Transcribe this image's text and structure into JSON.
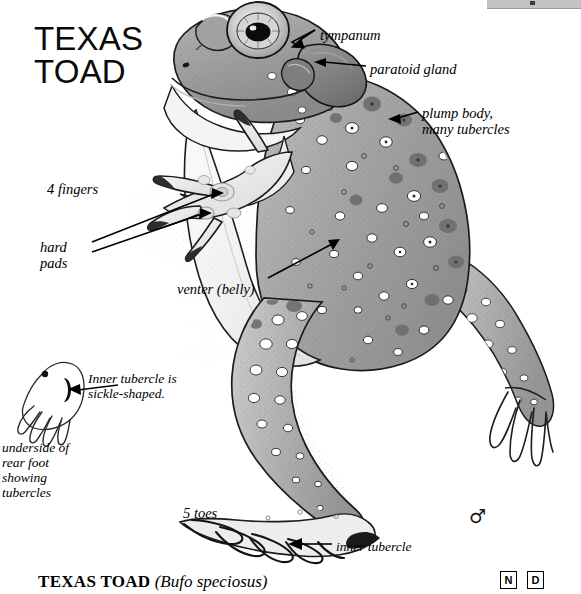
{
  "plate": {
    "title": "TEXAS\nTOAD",
    "background_color": "#ffffff",
    "ink_color": "#000000"
  },
  "top_bar": {
    "present": true,
    "color": "#c3c3c3"
  },
  "labels": [
    {
      "id": "tympanum",
      "text": "tympanum",
      "x": 320,
      "y": 27
    },
    {
      "id": "paratoid",
      "text": "paratoid gland",
      "x": 370,
      "y": 61
    },
    {
      "id": "plump_body",
      "text": "plump body,\nmany tubercles",
      "x": 422,
      "y": 105
    },
    {
      "id": "four_fingers",
      "text": "4 fingers",
      "x": 47,
      "y": 181
    },
    {
      "id": "hard_pads",
      "text": "hard\npads",
      "x": 40,
      "y": 239
    },
    {
      "id": "venter",
      "text": "venter (belly)",
      "x": 177,
      "y": 281
    },
    {
      "id": "inner_tubercle_note",
      "text": "Inner tubercle is\nsickle-shaped.",
      "x": 88,
      "y": 371
    },
    {
      "id": "underside_note",
      "text": "underside of\nrear foot\nshowing\ntubercles",
      "x": 2,
      "y": 440
    },
    {
      "id": "five_toes",
      "text": "5 toes",
      "x": 183,
      "y": 505
    },
    {
      "id": "inner_tubercle",
      "text": "inner tubercle",
      "x": 336,
      "y": 539
    }
  ],
  "caption": {
    "common_name": "TEXAS TOAD",
    "scientific_name": "(Bufo speciosus)"
  },
  "corner_codes": [
    {
      "letter": "N"
    },
    {
      "letter": "D"
    }
  ],
  "sex_symbol": {
    "glyph": "♂",
    "meaning": "male"
  },
  "illustration": {
    "subject": "texas-toad",
    "view": "dorsolateral, upright",
    "features": [
      "tympanum",
      "paratoid gland",
      "plump body with many tubercles",
      "4 fingers with hard pads",
      "venter (belly)",
      "5 toes",
      "sickle-shaped inner tubercle",
      "underside of rear foot showing tubercles"
    ]
  }
}
